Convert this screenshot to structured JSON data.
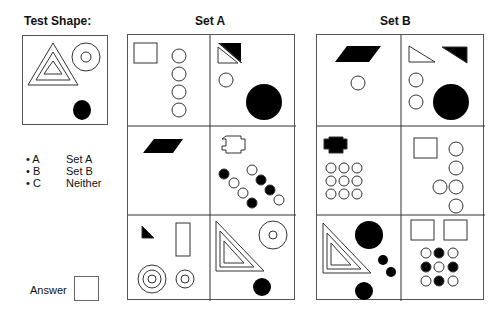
{
  "header": {
    "test_shape_title": "Test Shape:",
    "set_a_title": "Set A",
    "set_b_title": "Set B"
  },
  "legend": {
    "items": [
      {
        "key": "A",
        "label": "Set A"
      },
      {
        "key": "B",
        "label": "Set B"
      },
      {
        "key": "C",
        "label": "Neither"
      }
    ]
  },
  "answer": {
    "label": "Answer",
    "value": ""
  },
  "test_shape": {
    "shapes": [
      "triple-nested-triangle-outline",
      "concentric-circle-outline",
      "black-filled-circle"
    ]
  },
  "set_a": {
    "cells": [
      {
        "shapes": [
          "square-outline",
          "four-circles-vertical-outline"
        ]
      },
      {
        "shapes": [
          "square-split-diagonal-black-white",
          "small-circle-outline",
          "large-black-circle"
        ]
      },
      {
        "shapes": [
          "black-parallelogram"
        ]
      },
      {
        "shapes": [
          "notched-rectangle-outline",
          "diagonal-dots-black-and-white"
        ]
      },
      {
        "shapes": [
          "small-black-right-triangle",
          "tall-rectangle-outline",
          "triple-concentric-circles",
          "double-concentric-circles"
        ]
      },
      {
        "shapes": [
          "double-nested-right-triangle-outline",
          "concentric-circle-outline",
          "black-circle"
        ]
      }
    ]
  },
  "set_b": {
    "cells": [
      {
        "shapes": [
          "black-parallelogram",
          "small-circle-outline"
        ]
      },
      {
        "shapes": [
          "white-right-triangle",
          "black-right-triangle",
          "two-circles-outline",
          "large-black-circle"
        ]
      },
      {
        "shapes": [
          "black-notched-rectangle",
          "3x3-circles-outline"
        ]
      },
      {
        "shapes": [
          "square-outline",
          "five-circles-outline"
        ]
      },
      {
        "shapes": [
          "double-nested-right-triangle-outline",
          "large-black-circle",
          "two-small-black-circles",
          "black-circle"
        ]
      },
      {
        "shapes": [
          "two-squares-outline",
          "3x3-checker-circles-black-white"
        ]
      }
    ]
  }
}
